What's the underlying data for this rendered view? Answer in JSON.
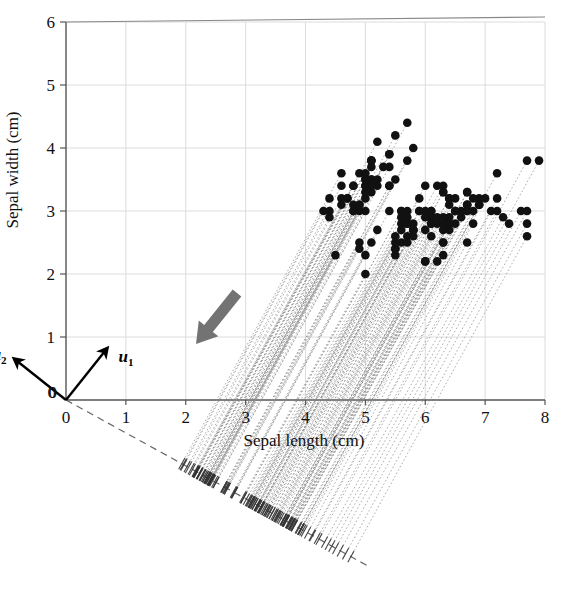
{
  "figure": {
    "domain": "chart",
    "origin_label": "0",
    "origin_label_y": "0"
  },
  "axes": {
    "x": {
      "title": "Sepal length (cm)",
      "ticks": [
        "0",
        "1",
        "2",
        "3",
        "4",
        "5",
        "6",
        "7",
        "8"
      ],
      "min": 0,
      "max": 8
    },
    "y": {
      "title": "Sepal width (cm)",
      "ticks": [
        "0",
        "1",
        "2",
        "3",
        "4",
        "5",
        "6"
      ],
      "min": 0,
      "max": 6
    }
  },
  "vectors": [
    {
      "name": "u1",
      "base": "u",
      "sub": "1",
      "label": "u₁",
      "dx": 0.62,
      "dy": 0.78
    },
    {
      "name": "u2",
      "base": "u",
      "sub": "2",
      "label": "u₂",
      "dx": -0.78,
      "dy": 0.62
    }
  ],
  "annotations": {
    "arrow": {
      "name": "direction-arrow",
      "color": "#737373",
      "angle_deg": 231,
      "tail": [
        237,
        293
      ],
      "head": [
        196,
        344
      ]
    },
    "projection_axis": {
      "name": "projection-axis",
      "style": "dashed",
      "color": "#666666",
      "from": [
        66,
        400
      ],
      "to": [
        368,
        566
      ]
    }
  },
  "colors": {
    "point": "#111111",
    "grid": "#dcdcdc",
    "axis": "#555555",
    "projection_line": "#8f8f8f",
    "arrow": "#737373",
    "tick_mark": "#333333"
  },
  "chart_data": {
    "type": "scatter",
    "title": "",
    "subtitle": "",
    "xlabel": "Sepal length (cm)",
    "ylabel": "Sepal width (cm)",
    "xlim": [
      0,
      8
    ],
    "ylim": [
      0,
      6
    ],
    "xticks": [
      0,
      1,
      2,
      3,
      4,
      5,
      6,
      7,
      8
    ],
    "yticks": [
      0,
      1,
      2,
      3,
      4,
      5,
      6
    ],
    "grid": true,
    "legend": null,
    "annotations": [
      {
        "type": "vector",
        "label": "u1",
        "note": "first principal direction, up-right from origin"
      },
      {
        "type": "vector",
        "label": "u2",
        "note": "second principal direction, up-left from origin"
      },
      {
        "type": "arrow",
        "label": "projection-direction",
        "note": "thick gray arrow pointing down-left"
      },
      {
        "type": "dashed-line",
        "label": "projection-axis",
        "note": "1-D subspace onto which points are projected"
      }
    ],
    "series": [
      {
        "name": "Iris sepal measurements",
        "marker": "filled-circle",
        "color": "#111111",
        "x": [
          5.1,
          4.9,
          4.7,
          4.6,
          5.0,
          5.4,
          4.6,
          5.0,
          4.4,
          4.9,
          5.4,
          4.8,
          4.8,
          4.3,
          5.8,
          5.7,
          5.4,
          5.1,
          5.7,
          5.1,
          5.4,
          5.1,
          4.6,
          5.1,
          4.8,
          5.0,
          5.0,
          5.2,
          5.2,
          4.7,
          4.8,
          5.4,
          5.2,
          5.5,
          4.9,
          5.0,
          5.5,
          4.9,
          4.4,
          5.1,
          5.0,
          4.5,
          4.4,
          5.0,
          5.1,
          4.8,
          5.1,
          4.6,
          5.3,
          5.0,
          7.0,
          6.4,
          6.9,
          5.5,
          6.5,
          5.7,
          6.3,
          4.9,
          6.6,
          5.2,
          5.0,
          5.9,
          6.0,
          6.1,
          5.6,
          6.7,
          5.6,
          5.8,
          6.2,
          5.6,
          5.9,
          6.1,
          6.3,
          6.1,
          6.4,
          6.6,
          6.8,
          6.7,
          6.0,
          5.7,
          5.5,
          5.5,
          5.8,
          6.0,
          5.4,
          6.0,
          6.7,
          6.3,
          5.6,
          5.5,
          5.5,
          6.1,
          5.8,
          5.0,
          5.6,
          5.7,
          5.7,
          6.2,
          5.1,
          5.7,
          6.3,
          5.8,
          7.1,
          6.3,
          6.5,
          7.6,
          4.9,
          7.3,
          6.7,
          7.2,
          6.5,
          6.4,
          6.8,
          5.7,
          5.8,
          6.4,
          6.5,
          7.7,
          7.7,
          6.0,
          6.9,
          5.6,
          7.7,
          6.3,
          6.7,
          7.2,
          6.2,
          6.1,
          6.4,
          7.2,
          7.4,
          7.9,
          6.4,
          6.3,
          6.1,
          7.7,
          6.3,
          6.4,
          6.0,
          6.9,
          6.7,
          6.9,
          5.8,
          6.8,
          6.7,
          6.7,
          6.3,
          6.5,
          6.2,
          5.9
        ],
        "y": [
          3.5,
          3.0,
          3.2,
          3.1,
          3.6,
          3.9,
          3.4,
          3.4,
          2.9,
          3.1,
          3.7,
          3.4,
          3.0,
          3.0,
          4.0,
          4.4,
          3.9,
          3.5,
          3.8,
          3.8,
          3.4,
          3.7,
          3.6,
          3.3,
          3.4,
          3.0,
          3.4,
          3.5,
          3.4,
          3.2,
          3.1,
          3.4,
          4.1,
          4.2,
          3.1,
          3.2,
          3.5,
          3.6,
          3.0,
          3.4,
          3.5,
          2.3,
          3.2,
          3.5,
          3.8,
          3.0,
          3.8,
          3.2,
          3.7,
          3.3,
          3.2,
          3.2,
          3.1,
          2.3,
          2.8,
          2.8,
          3.3,
          2.4,
          2.9,
          2.7,
          2.0,
          3.0,
          2.2,
          2.9,
          2.9,
          3.1,
          3.0,
          2.7,
          2.2,
          2.5,
          3.2,
          2.8,
          2.5,
          2.8,
          2.9,
          3.0,
          2.8,
          3.0,
          2.9,
          2.6,
          2.4,
          2.4,
          2.7,
          2.7,
          3.0,
          3.4,
          3.1,
          2.3,
          3.0,
          2.5,
          2.6,
          3.0,
          2.6,
          2.3,
          2.7,
          3.0,
          2.9,
          2.9,
          2.5,
          2.8,
          3.3,
          2.7,
          3.0,
          2.9,
          3.0,
          3.0,
          2.5,
          2.9,
          2.5,
          3.6,
          3.2,
          2.7,
          3.0,
          2.5,
          2.8,
          3.2,
          3.0,
          3.8,
          2.6,
          2.2,
          3.2,
          2.8,
          2.8,
          2.7,
          3.3,
          3.2,
          2.8,
          3.0,
          2.8,
          3.0,
          2.8,
          3.8,
          2.8,
          2.8,
          2.6,
          3.0,
          3.4,
          3.1,
          3.0,
          3.1,
          3.1,
          3.1,
          2.7,
          3.2,
          3.3,
          3.0,
          2.5,
          3.0,
          3.4,
          3.0
        ]
      }
    ]
  }
}
